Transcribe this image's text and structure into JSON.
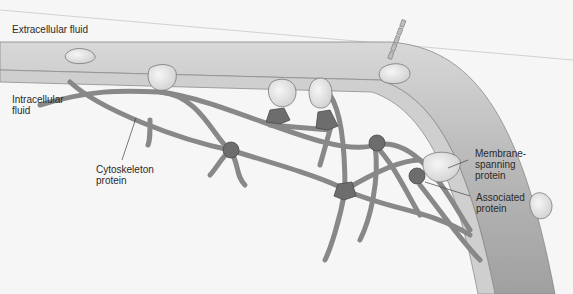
{
  "diagram": {
    "colors": {
      "background": "#f6f6f6",
      "membrane_outer": "#a8a8a8",
      "membrane_inner": "#c9c9c9",
      "cytoskeleton": "#8a8a8a",
      "membrane_protein": "#e4e4e4",
      "associated_protein": "#6d6d6d"
    },
    "labels": {
      "extracellular": "Extracellular fluid",
      "intracellular": "Intracellular\nfluid",
      "cytoskeleton": "Cytoskeleton\nprotein",
      "membrane_spanning": "Membrane-\nspanning\nprotein",
      "associated": "Associated\nprotein"
    }
  }
}
